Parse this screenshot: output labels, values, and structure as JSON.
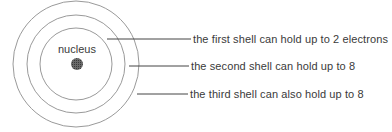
{
  "diagram": {
    "nucleus": {
      "label": "nucleus",
      "color": "#555555"
    },
    "shells": [
      {
        "index": 1,
        "label": "the first shell can hold up to 2 electrons",
        "capacity": 2
      },
      {
        "index": 2,
        "label": "the second shell can hold up to 8",
        "capacity": 8
      },
      {
        "index": 3,
        "label": "the third shell can also hold up to 8",
        "capacity": 8
      }
    ],
    "colors": {
      "stroke": "#8a8a8a",
      "leader": "#444444",
      "text": "#3a3a3a"
    }
  }
}
